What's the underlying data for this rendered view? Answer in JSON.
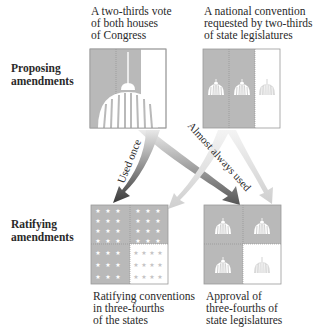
{
  "rows": {
    "proposing": "Proposing\namendments",
    "ratifying": "Ratifying\namendments"
  },
  "proposing_methods": [
    {
      "caption_lines": [
        "A two-thirds vote",
        "of both houses",
        "of Congress"
      ],
      "icon": "capitol-dome-icon"
    },
    {
      "caption_lines": [
        "A national convention",
        "requested by two-thirds",
        "of state legislatures"
      ],
      "icon": "three-domes-icon"
    }
  ],
  "ratifying_methods": [
    {
      "caption_lines": [
        "Ratifying conventions",
        "in three-fourths",
        "of the states"
      ],
      "icon": "stars-grid-icon"
    },
    {
      "caption_lines": [
        "Approval of",
        "three-fourths of",
        "state legislatures"
      ],
      "icon": "four-domes-icon"
    }
  ],
  "arrows": {
    "used_once": "Used once",
    "almost_always_used": "Almost always used"
  },
  "colors": {
    "box_fill": "#b9b9b9",
    "box_border": "#9a9a9a",
    "arrow_dark": "#3a3a3a",
    "arrow_light": "#d6d6d6",
    "text": "#2a2a2a"
  }
}
